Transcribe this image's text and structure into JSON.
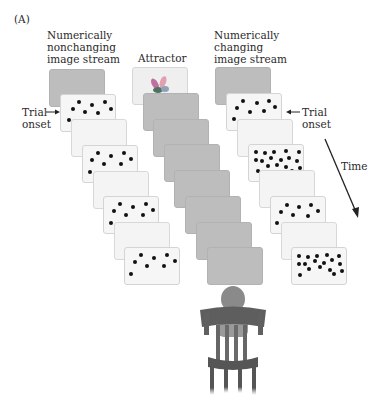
{
  "figure": {
    "panel_label": "(A)",
    "columns": [
      {
        "id": "nonchanging",
        "title": "Numerically\nnonchanging\nimage stream"
      },
      {
        "id": "attractor",
        "title": "Attractor"
      },
      {
        "id": "changing",
        "title": "Numerically\nchanging\nimage stream"
      }
    ],
    "annotations": {
      "trial_onset_left": "Trial\nonset",
      "trial_onset_right": "Trial\nonset",
      "time_label": "Time"
    },
    "colors": {
      "gray_card": "#bdbdbd",
      "light_card": "#f4f4f4",
      "dot": "#111111",
      "text": "#2a2a2a"
    },
    "streams": {
      "nonchanging": [
        "gray",
        "dots-8",
        "blank",
        "dots-8",
        "blank",
        "dots-8",
        "blank",
        "dots-8"
      ],
      "attractor": [
        "attractor-image",
        "gray",
        "gray",
        "gray",
        "gray",
        "gray",
        "gray",
        "gray"
      ],
      "changing": [
        "gray",
        "dots-8",
        "blank",
        "dots-20",
        "blank",
        "dots-8",
        "blank",
        "dots-20"
      ]
    },
    "observer": "child seated in wooden chair, viewed from behind"
  }
}
